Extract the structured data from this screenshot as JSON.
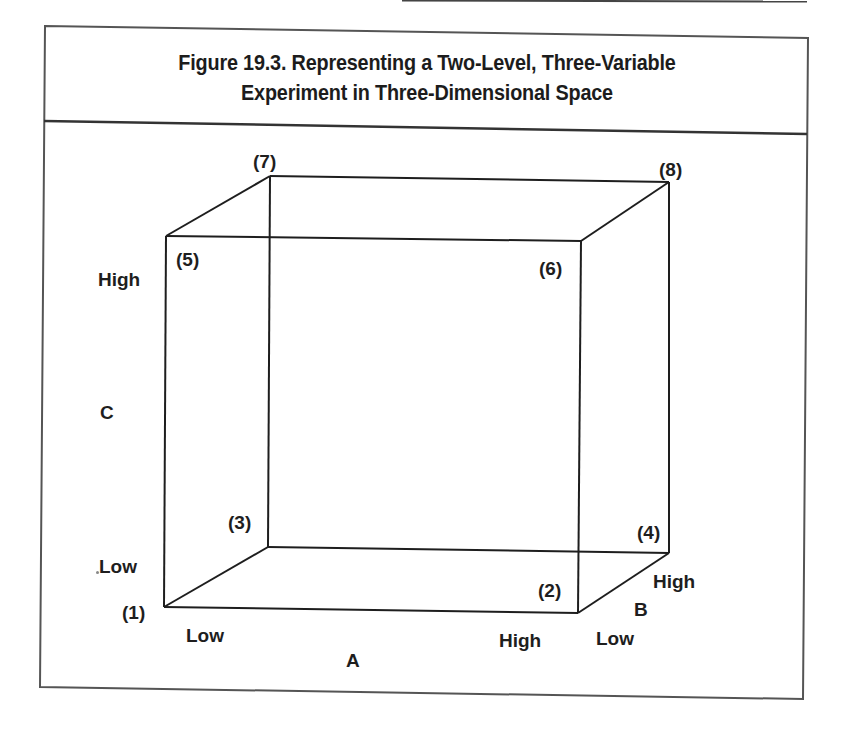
{
  "figure": {
    "title_line1": "Figure 19.3.  Representing a Two-Level, Three-Variable",
    "title_line2": "Experiment in Three-Dimensional Space"
  },
  "vertices": [
    {
      "id": "1",
      "label": "(1)"
    },
    {
      "id": "2",
      "label": "(2)"
    },
    {
      "id": "3",
      "label": "(3)"
    },
    {
      "id": "4",
      "label": "(4)"
    },
    {
      "id": "5",
      "label": "(5)"
    },
    {
      "id": "6",
      "label": "(6)"
    },
    {
      "id": "7",
      "label": "(7)"
    },
    {
      "id": "8",
      "label": "(8)"
    }
  ],
  "axes": {
    "a": {
      "name": "A",
      "low": "Low",
      "high": "High"
    },
    "b": {
      "name": "B",
      "low": "Low",
      "high": "High"
    },
    "c": {
      "name": "C",
      "low": "Low",
      "high": "High"
    }
  },
  "colors": {
    "line": "#1e1e1e",
    "frame": "#555555",
    "background": "#ffffff"
  }
}
